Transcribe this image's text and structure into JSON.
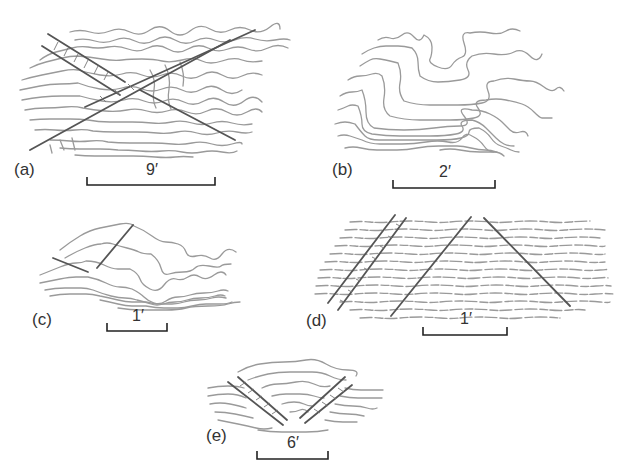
{
  "figure": {
    "panels": [
      {
        "id": "a",
        "label": "(a)",
        "scale": "9′"
      },
      {
        "id": "b",
        "label": "(b)",
        "scale": "2′"
      },
      {
        "id": "c",
        "label": "(c)",
        "scale": "1′"
      },
      {
        "id": "d",
        "label": "(d)",
        "scale": "1′"
      },
      {
        "id": "e",
        "label": "(e)",
        "scale": "6′"
      }
    ]
  },
  "colors": {
    "contour": "#9a9a9a",
    "joint": "#555555",
    "scalebar": "#222222",
    "text": "#333333"
  }
}
